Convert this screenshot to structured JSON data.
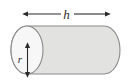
{
  "figure": {
    "name": "cylinder-dimensions-diagram",
    "type": "geometry-diagram",
    "shape": "cylinder",
    "background_color": "#ffffff",
    "labels": {
      "height": "h",
      "radius": "r"
    },
    "colors": {
      "body_fill": "#e2e2e0",
      "end_face_fill": "#f7f7f7",
      "outline": "#8a8a8a",
      "arrow": "#2b2b2b",
      "text": "#2b2b2b"
    },
    "geometry": {
      "left_ellipse_center_x": 27,
      "left_ellipse_center_y": 50,
      "left_ellipse_rx": 16,
      "left_ellipse_ry": 24,
      "body_right_x": 104,
      "right_cap_rx": 16,
      "top_y": 26,
      "bottom_y": 74
    },
    "dimension_arrows": [
      {
        "name": "height-arrow",
        "label": "h",
        "orientation": "horizontal",
        "double_headed": true,
        "x_start": 28,
        "x_end": 105,
        "y": 14
      },
      {
        "name": "radius-arrow",
        "label": "r",
        "orientation": "vertical",
        "double_headed": true,
        "x": 27,
        "y_start": 48,
        "y_end": 72
      }
    ]
  }
}
